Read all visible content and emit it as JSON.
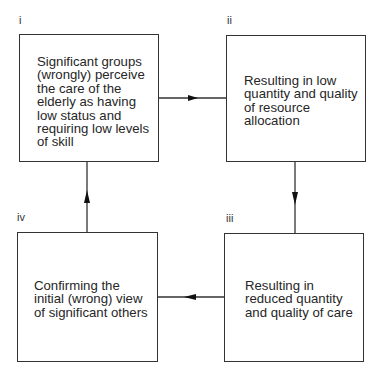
{
  "diagram": {
    "type": "cycle",
    "nodes": [
      {
        "id": "i",
        "label": "i",
        "text": "Significant groups (wrongly) perceive the care of the elderly as having low status and requiring low levels of skill",
        "lines": [
          "Significant groups",
          "(wrongly) perceive",
          "the care of the",
          "elderly as having",
          "low status and",
          "requiring low levels",
          "of skill"
        ]
      },
      {
        "id": "ii",
        "label": "ii",
        "text": "Resulting in low quantity and quality of resource allocation",
        "lines": [
          "Resulting in low",
          "quantity and quality",
          "of resource",
          "allocation"
        ]
      },
      {
        "id": "iii",
        "label": "iii",
        "text": "Resulting in reduced quantity and quality of care",
        "lines": [
          "Resulting in",
          "reduced quantity",
          "and quality of care"
        ]
      },
      {
        "id": "iv",
        "label": "iv",
        "text": "Confirming the initial (wrong) view of significant others",
        "lines": [
          "Confirming the",
          "initial (wrong) view",
          "of significant others"
        ]
      }
    ],
    "edges": [
      {
        "from": "i",
        "to": "ii",
        "direction": "right"
      },
      {
        "from": "ii",
        "to": "iii",
        "direction": "down"
      },
      {
        "from": "iii",
        "to": "iv",
        "direction": "left"
      },
      {
        "from": "iv",
        "to": "i",
        "direction": "up"
      }
    ],
    "colors": {
      "line": "#333333",
      "text": "#262626",
      "background": "#ffffff"
    }
  }
}
